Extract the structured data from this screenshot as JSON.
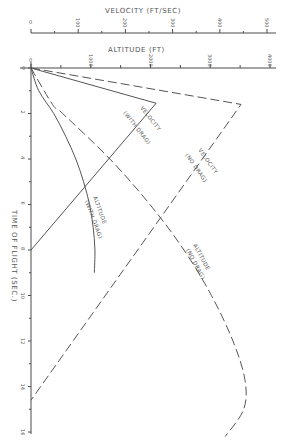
{
  "chart_data": {
    "type": "line",
    "title": "",
    "orientation": "rotated (time axis vertical on left, value axes horizontal on top)",
    "x_axis": {
      "label": "TIME OF FLIGHT (SEC.)",
      "range": [
        0,
        16
      ],
      "ticks": [
        0,
        2,
        4,
        6,
        8,
        10,
        12,
        14,
        16
      ],
      "tick_labels": [
        "0",
        "2",
        "4",
        "6",
        "8",
        "10",
        "12",
        "14",
        "16"
      ]
    },
    "y_axes": [
      {
        "id": "velocity",
        "label": "VELOCITY (FT/SEC)",
        "range": [
          0,
          500
        ],
        "ticks": [
          0,
          100,
          200,
          300,
          400,
          500
        ],
        "tick_labels": [
          "0",
          "100",
          "200",
          "300",
          "400",
          "500"
        ]
      },
      {
        "id": "altitude",
        "label": "ALTITUDE (FT)",
        "range": [
          0,
          4000
        ],
        "ticks": [
          0,
          1000,
          2000,
          3000,
          4000
        ],
        "tick_labels": [
          "0",
          "1000",
          "2000",
          "3000",
          "4000"
        ]
      }
    ],
    "series": [
      {
        "name": "VELOCITY (NO DRAG)",
        "axis": "velocity",
        "style": "dashed",
        "x": [
          0,
          1.6,
          14.6
        ],
        "values": [
          0,
          445,
          0
        ]
      },
      {
        "name": "VELOCITY (WITH DRAG)",
        "axis": "velocity",
        "style": "solid",
        "x": [
          0,
          1.55,
          8.0
        ],
        "values": [
          0,
          265,
          0
        ]
      },
      {
        "name": "ALTITUDE (WITH DRAG)",
        "axis": "altitude",
        "style": "solid",
        "x": [
          0,
          1,
          2,
          3,
          4,
          5,
          6,
          7,
          8,
          9
        ],
        "values": [
          0,
          130,
          380,
          580,
          750,
          880,
          980,
          1040,
          1070,
          1060
        ]
      },
      {
        "name": "ALTITUDE (NO DRAG)",
        "axis": "altitude",
        "style": "dashed",
        "x": [
          0,
          1.6,
          2,
          4,
          6,
          8,
          10,
          12,
          13.7,
          15,
          16.2
        ],
        "values": [
          0,
          360,
          530,
          1320,
          1990,
          2560,
          3020,
          3380,
          3580,
          3560,
          3250
        ]
      }
    ],
    "legend": "inline labels along curves",
    "grid": false
  }
}
